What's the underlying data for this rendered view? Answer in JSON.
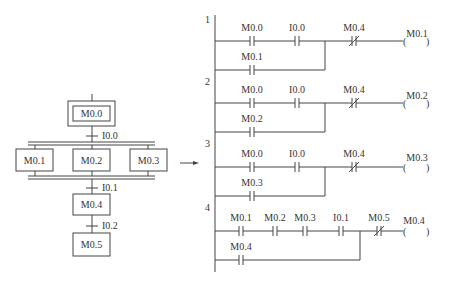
{
  "sfc": {
    "initial_step": "M0.0",
    "transitions": [
      "I0.0",
      "I0.1",
      "I0.2"
    ],
    "parallel_steps": [
      "M0.1",
      "M0.2",
      "M0.3"
    ],
    "steps_after": [
      "M0.4",
      "M0.5"
    ]
  },
  "ladder": {
    "rungs": [
      {
        "number": "1",
        "series": [
          "M0.0",
          "I0.0"
        ],
        "nc": "M0.4",
        "branch": "M0.1",
        "coil": "M0.1"
      },
      {
        "number": "2",
        "series": [
          "M0.0",
          "I0.0"
        ],
        "nc": "M0.4",
        "branch": "M0.2",
        "coil": "M0.2"
      },
      {
        "number": "3",
        "series": [
          "M0.0",
          "I0.0"
        ],
        "nc": "M0.4",
        "branch": "M0.3",
        "coil": "M0.3"
      },
      {
        "number": "4",
        "series": [
          "M0.1",
          "M0.2",
          "M0.3",
          "I0.1"
        ],
        "nc": "M0.5",
        "branch": "M0.4",
        "coil": "M0.4"
      }
    ]
  },
  "colors": {
    "line": "#444444",
    "text": "#333333",
    "background": "#ffffff"
  }
}
